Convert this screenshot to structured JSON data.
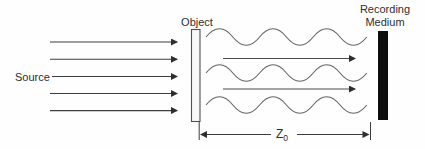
{
  "diagram": {
    "source_label": "Source",
    "object_label": "Object",
    "recording_medium_label": [
      "Recording",
      "Medium"
    ],
    "dimension_label": {
      "main": "Z",
      "sub": "0"
    },
    "plane_wave_arrow_count": 5,
    "transmitted_wave_count": 3,
    "transmitted_arrow_count": 2,
    "colors": {
      "background": "#fefefe",
      "line": "#3d3d3d",
      "wave": "#636363",
      "text": "#2e2e2e",
      "object_fill": "#f7f7f7",
      "recording_medium_fill": "#0e0e0e"
    }
  }
}
